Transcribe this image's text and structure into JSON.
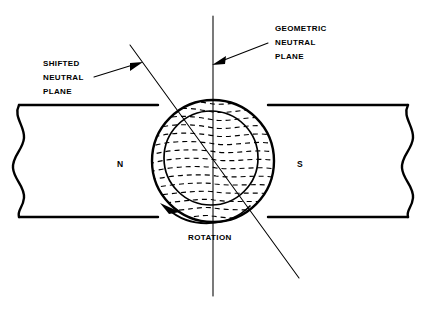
{
  "figure": {
    "background_color": "#ffffff",
    "ink_color": "#000000",
    "labels": {
      "geometric_neutral_plane": [
        "GEOMETRIC",
        "NEUTRAL",
        "PLANE"
      ],
      "shifted_neutral_plane": [
        "SHIFTED",
        "NEUTRAL",
        "PLANE"
      ],
      "rotation": "ROTATION",
      "north_pole": "N",
      "south_pole": "S"
    },
    "parts": {
      "pole_piece_left": "north-pole-piece",
      "pole_piece_right": "south-pole-piece",
      "armature_outer": "armature-outer-circle",
      "armature_inner": "armature-inner-circle",
      "flux_lines": "distorted-flux-field-lines",
      "geometric_plane_line": "vertical-geometric-neutral-plane-line",
      "shifted_plane_line": "diagonal-shifted-neutral-plane-line",
      "rotation_arc": "counter-rotation-arc-arrow",
      "break_line_left": "left-break-squiggle",
      "break_line_right": "right-break-squiggle"
    },
    "geometry": {
      "armature_center": [
        213,
        161
      ],
      "armature_outer_radius": 62,
      "armature_inner_radius": 47,
      "armature_inner_center": [
        211,
        158
      ],
      "pole_gap_top_y": 105,
      "pole_gap_bottom_y": 217,
      "geometric_plane_x": 213,
      "shifted_plane_angle_deg": 37
    }
  }
}
